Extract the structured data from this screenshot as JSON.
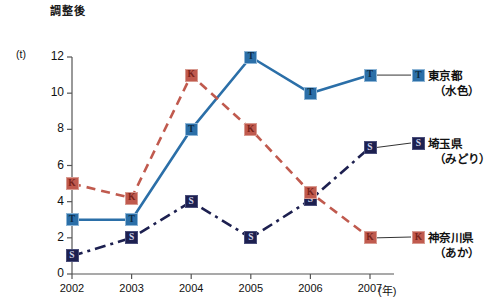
{
  "chart_data": {
    "type": "line",
    "title": "調整後",
    "xlabel": "(年)",
    "ylabel": "(t)",
    "categories": [
      "2002",
      "2003",
      "2004",
      "2005",
      "2006",
      "2007"
    ],
    "ylim": [
      0,
      12
    ],
    "ytick_labels": [
      "0",
      "2",
      "4",
      "6",
      "8",
      "10",
      "12"
    ],
    "ytick_values": [
      0,
      2,
      4,
      6,
      8,
      10,
      12
    ],
    "grid": false,
    "legend_position": "right",
    "series": [
      {
        "name": "東京都",
        "sub": "（水色）",
        "marker": "T",
        "color": "#2b6fa8",
        "linestyle": "solid",
        "values": [
          3,
          3,
          8,
          12,
          10,
          11
        ]
      },
      {
        "name": "埼玉県",
        "sub": "（みどり）",
        "marker": "S",
        "color": "#1d2050",
        "linestyle": "dashdot",
        "values": [
          1,
          2,
          4,
          2,
          4.1,
          7
        ]
      },
      {
        "name": "神奈川県",
        "sub": "（あか）",
        "marker": "K",
        "color": "#c05a4e",
        "linestyle": "dashed",
        "values": [
          5,
          4.2,
          11,
          8,
          4.5,
          2
        ]
      }
    ]
  }
}
